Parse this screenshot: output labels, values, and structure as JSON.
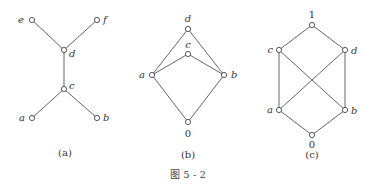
{
  "figure": {
    "caption": "图 5 - 2",
    "diagrams": [
      {
        "id": "a",
        "label": "(a)",
        "nodes": [
          {
            "name": "e",
            "x": 32,
            "y": 20,
            "lx": 24,
            "ly": 23,
            "anchor": "end"
          },
          {
            "name": "f",
            "x": 97,
            "y": 20,
            "lx": 103,
            "ly": 23,
            "anchor": "start"
          },
          {
            "name": "d",
            "x": 64,
            "y": 50,
            "lx": 69,
            "ly": 57,
            "anchor": "start"
          },
          {
            "name": "c",
            "x": 64,
            "y": 89,
            "lx": 69,
            "ly": 89,
            "anchor": "start"
          },
          {
            "name": "a",
            "x": 32,
            "y": 118,
            "lx": 25,
            "ly": 121,
            "anchor": "end"
          },
          {
            "name": "b",
            "x": 97,
            "y": 118,
            "lx": 103,
            "ly": 121,
            "anchor": "start"
          }
        ],
        "edges": [
          [
            "e",
            "d"
          ],
          [
            "f",
            "d"
          ],
          [
            "d",
            "c"
          ],
          [
            "c",
            "a"
          ],
          [
            "c",
            "b"
          ]
        ]
      },
      {
        "id": "b",
        "label": "(b)",
        "nodes": [
          {
            "name": "d",
            "x": 188,
            "y": 29,
            "lx": 188,
            "ly": 22,
            "anchor": "middle"
          },
          {
            "name": "c",
            "x": 188,
            "y": 54,
            "lx": 188,
            "ly": 48,
            "anchor": "middle"
          },
          {
            "name": "a",
            "x": 152,
            "y": 75,
            "lx": 145,
            "ly": 78,
            "anchor": "end"
          },
          {
            "name": "b",
            "x": 224,
            "y": 75,
            "lx": 231,
            "ly": 78,
            "anchor": "start"
          },
          {
            "name": "0",
            "x": 188,
            "y": 122,
            "lx": 188,
            "ly": 137,
            "anchor": "middle",
            "upright": true
          }
        ],
        "edges": [
          [
            "a",
            "d"
          ],
          [
            "b",
            "d"
          ],
          [
            "a",
            "c"
          ],
          [
            "b",
            "c"
          ],
          [
            "a",
            "0"
          ],
          [
            "b",
            "0"
          ]
        ]
      },
      {
        "id": "c",
        "label": "(c)",
        "nodes": [
          {
            "name": "1",
            "x": 312,
            "y": 25,
            "lx": 312,
            "ly": 18,
            "anchor": "middle",
            "upright": true
          },
          {
            "name": "c",
            "x": 279,
            "y": 50,
            "lx": 273,
            "ly": 53,
            "anchor": "end"
          },
          {
            "name": "d",
            "x": 345,
            "y": 50,
            "lx": 351,
            "ly": 54,
            "anchor": "start"
          },
          {
            "name": "a",
            "x": 279,
            "y": 110,
            "lx": 273,
            "ly": 113,
            "anchor": "end"
          },
          {
            "name": "b",
            "x": 345,
            "y": 110,
            "lx": 351,
            "ly": 114,
            "anchor": "start"
          },
          {
            "name": "0",
            "x": 312,
            "y": 135,
            "lx": 312,
            "ly": 148,
            "anchor": "middle",
            "upright": true
          }
        ],
        "edges": [
          [
            "1",
            "c"
          ],
          [
            "1",
            "d"
          ],
          [
            "c",
            "a"
          ],
          [
            "d",
            "b"
          ],
          [
            "c",
            "b"
          ],
          [
            "d",
            "a"
          ],
          [
            "a",
            "0"
          ],
          [
            "b",
            "0"
          ]
        ]
      }
    ],
    "sublabel_positions": {
      "a": {
        "x": 65,
        "y": 156
      },
      "b": {
        "x": 188,
        "y": 158
      },
      "c": {
        "x": 312,
        "y": 158
      }
    },
    "caption_position": {
      "x": 188,
      "y": 178
    }
  }
}
